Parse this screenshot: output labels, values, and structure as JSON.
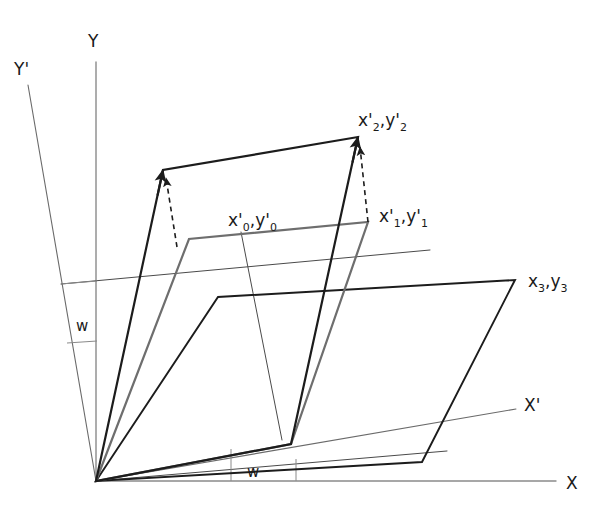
{
  "figure": {
    "background_color": "#ffffff",
    "width": 608,
    "height": 506,
    "origin": {
      "x": 96,
      "y": 481
    }
  },
  "colors": {
    "axis": "#8a8a8a",
    "stroke_dark": "#1c1c1c",
    "stroke_gray": "#6e6e6e",
    "stroke_thin": "#4a4a4a",
    "text": "#1a1a1a"
  },
  "axes": [
    {
      "id": "y-axis",
      "label": "Y",
      "label_x": 88,
      "label_y": 47,
      "x1": 96,
      "y1": 62,
      "x2": 96,
      "y2": 481,
      "color": "#8a8a8a",
      "width": 1.4
    },
    {
      "id": "x-axis",
      "label": "X",
      "label_x": 566,
      "label_y": 489,
      "x1": 96,
      "y1": 481,
      "x2": 556,
      "y2": 481,
      "color": "#8a8a8a",
      "width": 1.4
    },
    {
      "id": "y-prime-axis",
      "label": "Y'",
      "label_x": 14,
      "label_y": 75,
      "x1": 28,
      "y1": 85,
      "x2": 96,
      "y2": 481,
      "color": "#6a6a6a",
      "width": 1.1
    },
    {
      "id": "x-prime-axis",
      "label": "X'",
      "label_x": 524,
      "label_y": 411,
      "x1": 96,
      "y1": 481,
      "x2": 516,
      "y2": 409,
      "color": "#6a6a6a",
      "width": 1.1
    }
  ],
  "angle_marks": [
    {
      "id": "angle-w-vertical",
      "label": "w",
      "label_x": 76,
      "label_y": 331,
      "tick_x1": 61,
      "tick_y1": 284,
      "tick_x2": 97,
      "tick_y2": 281,
      "tick2_x1": 67,
      "tick2_y1": 343,
      "tick2_x2": 97,
      "tick2_y2": 341
    },
    {
      "id": "angle-w-horizontal",
      "label": "w",
      "label_x": 247,
      "label_y": 477,
      "tick_x1": 231,
      "tick_y1": 449,
      "tick_x2": 231,
      "tick_y2": 481,
      "tick2_x1": 296,
      "tick2_y1": 459,
      "tick2_x2": 296,
      "tick2_y2": 481
    }
  ],
  "shapes": {
    "tall_parallelogram": {
      "name": "rotated-tall-parallelogram",
      "points": "96,481 163,170 358,137 291,444",
      "color": "#1c1c1c",
      "width": 2.2
    },
    "gray_inner_parallelogram": {
      "name": "gray-inner-parallelogram",
      "points": "96,481 189,239 368,222 291,444",
      "color": "#6e6e6e",
      "width": 2.2
    },
    "flat_parallelogram": {
      "name": "flat-base-parallelogram",
      "points": "96,481 218,297 515,280 422,462",
      "color": "#1c1c1c",
      "width": 1.9
    },
    "thin_guide_line": {
      "name": "upper-thin-guide-line",
      "x1": 61,
      "y1": 284,
      "x2": 430,
      "y2": 250,
      "color": "#4a4a4a",
      "width": 1.0
    },
    "thin_lower_line": {
      "name": "lower-thin-guide-line",
      "x1": 96,
      "y1": 481,
      "x2": 447,
      "y2": 451,
      "color": "#4a4a4a",
      "width": 1.0
    },
    "drop_line_0": {
      "name": "drop-line-x0y0",
      "x1": 241,
      "y1": 232,
      "x2": 282,
      "y2": 440,
      "color": "#4a4a4a",
      "width": 1.0
    }
  },
  "dashed_arrows": [
    {
      "id": "dashed-arrow-left",
      "x1": 177,
      "y1": 247,
      "x2": 166,
      "y2": 178,
      "color": "#1c1c1c",
      "width": 1.6
    },
    {
      "id": "dashed-arrow-right",
      "x1": 368,
      "y1": 222,
      "x2": 360,
      "y2": 147,
      "color": "#1c1c1c",
      "width": 1.6
    }
  ],
  "point_labels": [
    {
      "id": "label-x0-y0",
      "base": "x'",
      "sub1": "0",
      "sep": ",y'",
      "sub2": "0",
      "x": 228,
      "y": 226
    },
    {
      "id": "label-x1-y1",
      "base": "x'",
      "sub1": "1",
      "sep": ",y'",
      "sub2": "1",
      "x": 379,
      "y": 222
    },
    {
      "id": "label-x2-y2",
      "base": "x'",
      "sub1": "2",
      "sep": ",y'",
      "sub2": "2",
      "x": 358,
      "y": 126
    },
    {
      "id": "label-x3-y3",
      "base": "x",
      "sub1": "3",
      "sep": ",y",
      "sub2": "3",
      "x": 528,
      "y": 287
    }
  ]
}
